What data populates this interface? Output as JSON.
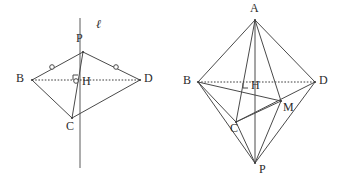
{
  "document": {
    "title": "Two geometry figures: planar kite with perpendicular line, and tetrahedral solid",
    "background_color": "#ffffff",
    "stroke_color": "#4a4a4a",
    "label_color": "#2b2b2b",
    "canvas": {
      "width": 354,
      "height": 185
    }
  },
  "figures": [
    {
      "id": "left-figure",
      "name": "kite-with-perpendicular-line",
      "description": "Quadrilateral B-P-D-C with vertical line l through P and C, diagonal BD dotted, right angle at H",
      "points": {
        "P": {
          "x": 83,
          "y": 52,
          "label": "P",
          "label_x": 76,
          "label_y": 38
        },
        "B": {
          "x": 32,
          "y": 80,
          "label": "B",
          "label_x": 18,
          "label_y": 74
        },
        "D": {
          "x": 140,
          "y": 80,
          "label": "D",
          "label_x": 144,
          "label_y": 74
        },
        "C": {
          "x": 72,
          "y": 118,
          "label": "C",
          "label_x": 66,
          "label_y": 120
        },
        "H": {
          "x": 78,
          "y": 80,
          "label": "H",
          "label_x": 82,
          "label_y": 82
        }
      },
      "line_label": {
        "text": "ℓ",
        "x": 96,
        "y": 24
      },
      "line_l": {
        "x1": 80,
        "y1": 18,
        "x2": 80,
        "y2": 168
      },
      "solid_edges": [
        {
          "from": "B",
          "to": "P"
        },
        {
          "from": "P",
          "to": "D"
        },
        {
          "from": "B",
          "to": "C"
        },
        {
          "from": "C",
          "to": "D"
        },
        {
          "from": "P",
          "to": "C"
        }
      ],
      "dotted_edges": [
        {
          "from": "B",
          "to": "D"
        }
      ],
      "tick_marks": [
        {
          "on": "PB",
          "x": 52,
          "y": 67
        },
        {
          "on": "PD",
          "x": 116,
          "y": 67
        },
        {
          "on": "PC",
          "x": 75,
          "y": 81
        }
      ],
      "right_angle": {
        "at": "H",
        "x": 78,
        "y": 80,
        "size": 5,
        "dir_x": 1,
        "dir_y": -1
      }
    },
    {
      "id": "right-figure",
      "name": "tetrahedral-solid-ABCDP",
      "description": "Solid with apex A, base vertices B, C, D, lower apex P, midpoint M, foot of perpendicular H with right angle mark",
      "points": {
        "A": {
          "x": 255,
          "y": 20,
          "label": "A",
          "label_x": 249,
          "label_y": 7
        },
        "B": {
          "x": 198,
          "y": 82,
          "label": "B",
          "label_x": 184,
          "label_y": 76
        },
        "D": {
          "x": 315,
          "y": 82,
          "label": "D",
          "label_x": 319,
          "label_y": 76
        },
        "C": {
          "x": 236,
          "y": 122,
          "label": "C",
          "label_x": 230,
          "label_y": 124
        },
        "P": {
          "x": 255,
          "y": 163,
          "label": "P",
          "label_x": 259,
          "label_y": 166
        },
        "H": {
          "x": 249,
          "y": 88,
          "label": "H",
          "label_x": 253,
          "label_y": 84
        },
        "M": {
          "x": 281,
          "y": 101,
          "label": "M",
          "label_x": 283,
          "label_y": 104
        }
      },
      "solid_edges": [
        {
          "from": "A",
          "to": "B"
        },
        {
          "from": "A",
          "to": "D"
        },
        {
          "from": "A",
          "to": "C"
        },
        {
          "from": "A",
          "to": "M"
        },
        {
          "from": "A",
          "to": "P"
        },
        {
          "from": "B",
          "to": "C"
        },
        {
          "from": "C",
          "to": "D"
        },
        {
          "from": "B",
          "to": "M"
        },
        {
          "from": "C",
          "to": "M"
        },
        {
          "from": "B",
          "to": "P"
        },
        {
          "from": "C",
          "to": "P"
        },
        {
          "from": "D",
          "to": "P"
        },
        {
          "from": "M",
          "to": "P"
        }
      ],
      "dotted_edges": [
        {
          "from": "B",
          "to": "D"
        }
      ],
      "right_angle": {
        "at": "H",
        "x": 249,
        "y": 88,
        "size": 5,
        "dir_x": -1,
        "dir_y": -1
      }
    }
  ]
}
